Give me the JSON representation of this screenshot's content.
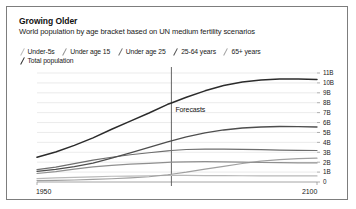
{
  "card": {
    "title": "Growing Older",
    "subtitle": "World population by age bracket based on UN medium fertility scenarios"
  },
  "legend": {
    "rows": [
      [
        {
          "label": "Under-5s",
          "color": "#b9b9b9"
        },
        {
          "label": "Under age 15",
          "color": "#8f8f8f"
        },
        {
          "label": "Under age 25",
          "color": "#6e6e6e"
        },
        {
          "label": "25-64 years",
          "color": "#4e4e4e"
        },
        {
          "label": "65+ years",
          "color": "#a0a0a0"
        }
      ],
      [
        {
          "label": "Total population",
          "color": "#2b2b2b"
        }
      ]
    ]
  },
  "annotations": {
    "forecast_label": "Forecasts",
    "forecast_year": 2022
  },
  "chart_data": {
    "type": "line",
    "title": "Growing Older",
    "subtitle": "World population by age bracket based on UN medium fertility scenarios",
    "xlabel": "",
    "ylabel": "",
    "xlim": [
      1950,
      2100
    ],
    "ylim": [
      0,
      11
    ],
    "grid": true,
    "legend_position": "top",
    "xticks": [
      1950,
      2100
    ],
    "xtick_labels": [
      "1950",
      "2100"
    ],
    "yticks": [
      0,
      1,
      2,
      3,
      4,
      5,
      6,
      7,
      8,
      9,
      10,
      11
    ],
    "ytick_labels": [
      "0",
      "1B",
      "2B",
      "3B",
      "4B",
      "5B",
      "6B",
      "7B",
      "8B",
      "9B",
      "10B",
      "11B"
    ],
    "x": [
      1950,
      1960,
      1970,
      1980,
      1990,
      2000,
      2010,
      2020,
      2022,
      2030,
      2040,
      2050,
      2060,
      2070,
      2080,
      2090,
      2100
    ],
    "series": [
      {
        "name": "Total population",
        "color": "#2b2b2b",
        "width": 1.5,
        "values": [
          2.5,
          3.03,
          3.7,
          4.45,
          5.32,
          6.14,
          6.96,
          7.84,
          7.98,
          8.55,
          9.2,
          9.73,
          10.1,
          10.3,
          10.4,
          10.4,
          10.35
        ]
      },
      {
        "name": "25-64 years",
        "color": "#4e4e4e",
        "width": 1.3,
        "values": [
          1.08,
          1.28,
          1.55,
          1.9,
          2.42,
          2.95,
          3.5,
          4.05,
          4.15,
          4.55,
          4.95,
          5.25,
          5.45,
          5.55,
          5.6,
          5.58,
          5.55
        ]
      },
      {
        "name": "Under age 25",
        "color": "#6e6e6e",
        "width": 1.2,
        "values": [
          1.24,
          1.5,
          1.85,
          2.2,
          2.5,
          2.75,
          2.95,
          3.15,
          3.18,
          3.28,
          3.32,
          3.32,
          3.3,
          3.26,
          3.22,
          3.2,
          3.18
        ]
      },
      {
        "name": "Under age 15",
        "color": "#8f8f8f",
        "width": 1.2,
        "values": [
          0.86,
          1.04,
          1.3,
          1.52,
          1.68,
          1.8,
          1.88,
          1.99,
          2.0,
          2.04,
          2.05,
          2.03,
          2.0,
          1.97,
          1.95,
          1.93,
          1.92
        ]
      },
      {
        "name": "65+ years",
        "color": "#a0a0a0",
        "width": 1.2,
        "values": [
          0.13,
          0.16,
          0.2,
          0.26,
          0.33,
          0.42,
          0.53,
          0.73,
          0.78,
          0.99,
          1.3,
          1.58,
          1.87,
          2.1,
          2.26,
          2.35,
          2.4
        ]
      },
      {
        "name": "Under-5s",
        "color": "#b9b9b9",
        "width": 1.2,
        "values": [
          0.34,
          0.41,
          0.47,
          0.52,
          0.58,
          0.6,
          0.63,
          0.66,
          0.66,
          0.66,
          0.65,
          0.64,
          0.63,
          0.62,
          0.62,
          0.61,
          0.61
        ]
      }
    ]
  }
}
